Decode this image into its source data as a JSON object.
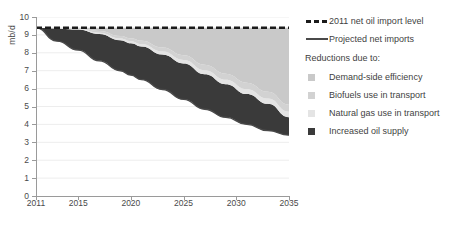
{
  "chart_data": {
    "type": "area",
    "title": "",
    "subtitle": "",
    "xlabel": "",
    "ylabel": "mb/d",
    "xlim": [
      2011,
      2035
    ],
    "ylim": [
      0,
      10
    ],
    "grid": true,
    "legend_position": "right",
    "x_ticks": [
      "2011",
      "2015",
      "2020",
      "2025",
      "2030",
      "2035"
    ],
    "x_tick_values": [
      2011,
      2015,
      2020,
      2025,
      2030,
      2035
    ],
    "y_ticks": [
      "0",
      "1",
      "2",
      "3",
      "4",
      "5",
      "6",
      "7",
      "8",
      "9",
      "10"
    ],
    "y_tick_values": [
      0,
      1,
      2,
      3,
      4,
      5,
      6,
      7,
      8,
      9,
      10
    ],
    "reference_line": {
      "name": "2011 net oil import level",
      "value": 9.4,
      "style": "dashed",
      "color": "#1b1b1b"
    },
    "x": [
      2011,
      2013,
      2015,
      2017,
      2019,
      2020,
      2021,
      2023,
      2025,
      2027,
      2029,
      2031,
      2033,
      2035
    ],
    "series": [
      {
        "name": "Projected net imports",
        "key": "projected_net_imports",
        "color": "#4a4a4a",
        "style": "line",
        "values": [
          9.4,
          8.65,
          8.15,
          7.55,
          7.0,
          6.75,
          6.5,
          5.95,
          5.4,
          4.85,
          4.4,
          4.0,
          3.65,
          3.4
        ]
      },
      {
        "name": "Increased oil supply",
        "key": "increased_oil_supply",
        "color": "#3a3a3a",
        "values": [
          0.0,
          0.7,
          1.15,
          1.5,
          1.7,
          1.78,
          1.85,
          1.95,
          2.0,
          1.95,
          1.85,
          1.7,
          1.5,
          1.0
        ]
      },
      {
        "name": "Natural gas use in transport",
        "key": "natural_gas_use_in_transport",
        "color": "#e4e4e4",
        "values": [
          0.0,
          0.02,
          0.04,
          0.07,
          0.1,
          0.12,
          0.14,
          0.17,
          0.2,
          0.23,
          0.25,
          0.27,
          0.29,
          0.3
        ]
      },
      {
        "name": "Biofuels use in transport",
        "key": "biofuels_use_in_transport",
        "color": "#d2d2d2",
        "values": [
          0.0,
          0.03,
          0.06,
          0.1,
          0.14,
          0.16,
          0.18,
          0.22,
          0.26,
          0.3,
          0.33,
          0.36,
          0.38,
          0.4
        ]
      },
      {
        "name": "Demand-side efficiency",
        "key": "demand_side_efficiency",
        "color": "#c9c9c9",
        "values": [
          0.0,
          0.0,
          0.0,
          0.18,
          0.46,
          0.59,
          0.73,
          1.11,
          1.54,
          2.07,
          2.57,
          3.07,
          3.58,
          4.3
        ]
      }
    ]
  },
  "axis": {
    "y_label": "mb/d"
  },
  "legend": {
    "reference_label": "2011 net oil import level",
    "projected_label": "Projected net imports",
    "group_title": "Reductions due to:",
    "items": [
      {
        "label": "Demand-side efficiency",
        "color": "#c9c9c9"
      },
      {
        "label": "Biofuels use in transport",
        "color": "#d2d2d2"
      },
      {
        "label": "Natural gas use in transport",
        "color": "#e4e4e4"
      },
      {
        "label": "Increased oil supply",
        "color": "#3a3a3a"
      }
    ]
  },
  "colors": {
    "axis": "#9a9a9a",
    "grid": "#ededed",
    "text": "#3f3f3f",
    "dark_band": "#3a3a3a",
    "reference": "#1b1b1b"
  }
}
